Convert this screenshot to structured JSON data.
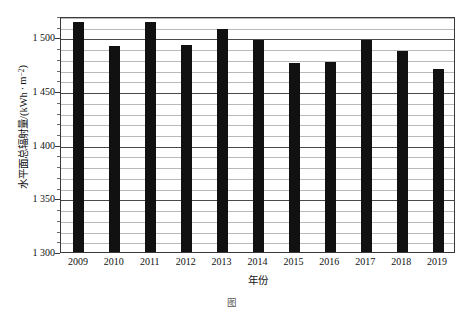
{
  "chart_data": {
    "type": "bar",
    "title": "",
    "xlabel": "年份",
    "ylabel": "水平面总辐射量/(kWh · m⁻²)",
    "ylabel_parts": {
      "main": "水平面总辐射量/(kWh",
      "middot": "·",
      "unit_base": "m",
      "unit_exp": "−2",
      "close": ")"
    },
    "categories": [
      "2009",
      "2010",
      "2011",
      "2012",
      "2013",
      "2014",
      "2015",
      "2016",
      "2017",
      "2018",
      "2019"
    ],
    "values": [
      1514,
      1492,
      1514,
      1493,
      1508,
      1498,
      1476,
      1477,
      1498,
      1487,
      1471
    ],
    "ylim": [
      1300,
      1520
    ],
    "ytick_values": [
      1300,
      1350,
      1400,
      1450,
      1500
    ],
    "ytick_labels": [
      "1 300",
      "1 350",
      "1 400",
      "1 450",
      "1 500"
    ],
    "minor_tick_interval": 10,
    "grid": true,
    "grid_axis": "y",
    "legend": "none",
    "bar_color": "#111111",
    "series": [
      {
        "name": "水平面总辐射量",
        "values": [
          1514,
          1492,
          1514,
          1493,
          1508,
          1498,
          1476,
          1477,
          1498,
          1487,
          1471
        ]
      }
    ]
  },
  "caption": {
    "label": "图",
    "number": "",
    "text": ""
  },
  "colors": {
    "bar": "#111111",
    "major_grid": "#4a4a4a",
    "minor_grid": "#b9b9b9",
    "frame": "#3a3a3a",
    "text": "#111111",
    "background": "#ffffff"
  }
}
